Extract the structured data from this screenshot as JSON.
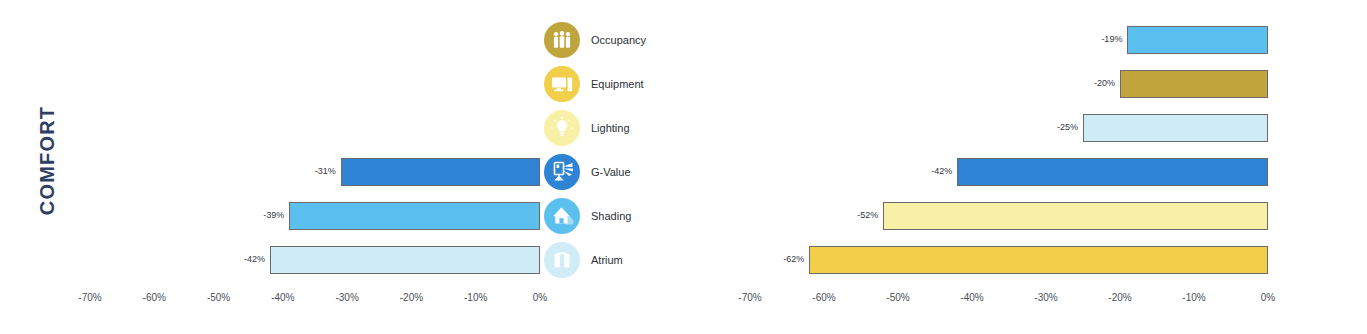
{
  "figure": {
    "category_label": "COMFORT"
  },
  "chart_data": [
    {
      "type": "bar",
      "orientation": "horizontal",
      "title": "COMFORT",
      "xlabel": "",
      "ylabel": "",
      "xlim": [
        -70,
        0
      ],
      "grid": false,
      "legend_position": "right",
      "axis_ticks": [
        "-70%",
        "-60%",
        "-50%",
        "-40%",
        "-30%",
        "-20%",
        "-10%",
        "0%"
      ],
      "axis_tick_values": [
        -70,
        -60,
        -50,
        -40,
        -30,
        -20,
        -10,
        0
      ],
      "categories": [
        "Occupancy",
        "Equipment",
        "Lighting",
        "G-Value",
        "Shading",
        "Atrium"
      ],
      "values": [
        null,
        null,
        null,
        -31,
        -39,
        -42
      ],
      "labels": [
        "",
        "",
        "",
        "-31%",
        "-39%",
        "-42%"
      ],
      "colors": [
        "#c0a43c",
        "#f2cf4a",
        "#f9f0a8",
        "#2e83d4",
        "#5bc0ee",
        "#cfecf7"
      ],
      "icons": [
        "occupancy-icon",
        "equipment-icon",
        "lighting-icon",
        "g-value-icon",
        "shading-icon",
        "atrium-icon"
      ]
    },
    {
      "type": "bar",
      "orientation": "horizontal",
      "title": "",
      "xlabel": "",
      "ylabel": "",
      "xlim": [
        -70,
        0
      ],
      "grid": false,
      "legend_position": "right",
      "axis_ticks": [
        "-70%",
        "-60%",
        "-50%",
        "-40%",
        "-30%",
        "-20%",
        "-10%",
        "0%"
      ],
      "axis_tick_values": [
        -70,
        -60,
        -50,
        -40,
        -30,
        -20,
        -10,
        0
      ],
      "categories": [
        "Shading",
        "Occupancy",
        "Atrium",
        "G-Value",
        "Lighting",
        "Equipment"
      ],
      "values": [
        -19,
        -20,
        -25,
        -42,
        -52,
        -62
      ],
      "labels": [
        "-19%",
        "-20%",
        "-25%",
        "-42%",
        "-52%",
        "-62%"
      ],
      "colors": [
        "#5bc0ee",
        "#c0a43c",
        "#cfecf7",
        "#2e83d4",
        "#f9f0a8",
        "#f2cf4a"
      ],
      "icons": [
        "shading-icon",
        "occupancy-icon",
        "atrium-icon",
        "g-value-icon",
        "lighting-icon",
        "equipment-icon"
      ]
    }
  ],
  "palette": {
    "occupancy": "#c0a43c",
    "equipment": "#f2cf4a",
    "lighting": "#f9f0a8",
    "g_value": "#2e83d4",
    "shading": "#5bc0ee",
    "atrium": "#cfecf7",
    "label_text": "#2e3f66",
    "bar_outline": "#6a6a6a"
  }
}
